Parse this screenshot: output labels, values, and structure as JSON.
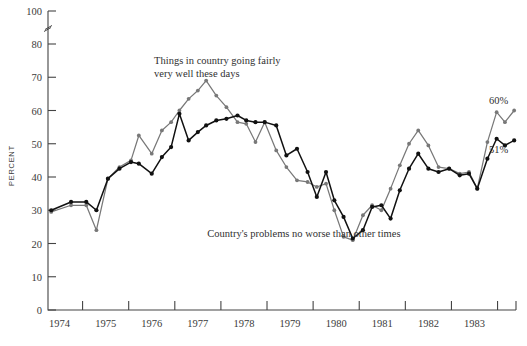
{
  "chart_data": {
    "type": "line",
    "title": "",
    "xlabel": "",
    "ylabel": "PERCENT",
    "ylim": [
      0,
      100
    ],
    "yticks": [
      0,
      10,
      20,
      30,
      40,
      50,
      60,
      70,
      80,
      100
    ],
    "axis_break_between": [
      80,
      100
    ],
    "grid": false,
    "legend": "annotations-inline",
    "xlim": [
      1973.75,
      1983.9
    ],
    "xticks": [
      1974,
      1975,
      1976,
      1977,
      1978,
      1979,
      1980,
      1981,
      1982,
      1983
    ],
    "xtick_labels": [
      "1974",
      "1975",
      "1976",
      "1977",
      "1978",
      "1979",
      "1980",
      "1981",
      "1982",
      "1983"
    ],
    "annotations": [
      {
        "name": "gray-series-annotation",
        "text_line1": "Things in country going fairly",
        "text_line2": "very well these days",
        "x": 1976.05,
        "y": 74
      },
      {
        "name": "black-series-annotation",
        "text": "Country's problems no worse than other times",
        "x": 1979.3,
        "y": 22
      }
    ],
    "end_labels": [
      {
        "name": "gray-end-label",
        "text": "60%",
        "value": 60,
        "color": "#777777"
      },
      {
        "name": "black-end-label",
        "text": "51%",
        "value": 51,
        "color": "#000000"
      }
    ],
    "series": [
      {
        "name": "Things in country going fairly very well these days",
        "color": "#787878",
        "marker": "circle",
        "points": [
          [
            1973.82,
            29.5
          ],
          [
            1974.25,
            31.5
          ],
          [
            1974.58,
            31.5
          ],
          [
            1974.8,
            24.0
          ],
          [
            1975.05,
            39.5
          ],
          [
            1975.3,
            43.0
          ],
          [
            1975.55,
            45.0
          ],
          [
            1975.72,
            52.5
          ],
          [
            1976.0,
            47.0
          ],
          [
            1976.22,
            54.0
          ],
          [
            1976.42,
            56.5
          ],
          [
            1976.6,
            60.0
          ],
          [
            1976.8,
            63.5
          ],
          [
            1977.0,
            66.0
          ],
          [
            1977.18,
            69.0
          ],
          [
            1977.4,
            64.5
          ],
          [
            1977.62,
            61.0
          ],
          [
            1977.86,
            56.5
          ],
          [
            1978.05,
            56.0
          ],
          [
            1978.25,
            50.5
          ],
          [
            1978.45,
            56.5
          ],
          [
            1978.7,
            48.0
          ],
          [
            1978.92,
            43.0
          ],
          [
            1979.15,
            39.0
          ],
          [
            1979.38,
            38.5
          ],
          [
            1979.58,
            37.0
          ],
          [
            1979.78,
            38.0
          ],
          [
            1979.96,
            30.0
          ],
          [
            1980.16,
            22.0
          ],
          [
            1980.36,
            21.0
          ],
          [
            1980.58,
            28.5
          ],
          [
            1980.78,
            31.5
          ],
          [
            1980.98,
            30.0
          ],
          [
            1981.18,
            36.5
          ],
          [
            1981.38,
            43.5
          ],
          [
            1981.58,
            50.0
          ],
          [
            1981.78,
            54.0
          ],
          [
            1982.0,
            49.5
          ],
          [
            1982.22,
            43.0
          ],
          [
            1982.45,
            42.5
          ],
          [
            1982.68,
            41.0
          ],
          [
            1982.88,
            41.5
          ],
          [
            1983.06,
            36.5
          ],
          [
            1983.28,
            50.5
          ],
          [
            1983.48,
            59.5
          ],
          [
            1983.66,
            56.5
          ],
          [
            1983.86,
            60.0
          ]
        ]
      },
      {
        "name": "Country's problems no worse than other times",
        "color": "#111111",
        "marker": "circle",
        "points": [
          [
            1973.82,
            30.0
          ],
          [
            1974.25,
            32.5
          ],
          [
            1974.58,
            32.5
          ],
          [
            1974.8,
            30.0
          ],
          [
            1975.05,
            39.5
          ],
          [
            1975.3,
            42.5
          ],
          [
            1975.55,
            44.5
          ],
          [
            1975.72,
            44.0
          ],
          [
            1976.0,
            41.0
          ],
          [
            1976.22,
            46.0
          ],
          [
            1976.42,
            49.0
          ],
          [
            1976.6,
            59.0
          ],
          [
            1976.8,
            51.0
          ],
          [
            1977.0,
            53.5
          ],
          [
            1977.18,
            55.5
          ],
          [
            1977.4,
            57.0
          ],
          [
            1977.62,
            57.5
          ],
          [
            1977.86,
            58.5
          ],
          [
            1978.05,
            57.0
          ],
          [
            1978.25,
            56.5
          ],
          [
            1978.45,
            56.5
          ],
          [
            1978.7,
            55.5
          ],
          [
            1978.92,
            46.5
          ],
          [
            1979.15,
            48.5
          ],
          [
            1979.38,
            41.5
          ],
          [
            1979.58,
            34.0
          ],
          [
            1979.78,
            41.5
          ],
          [
            1979.96,
            33.0
          ],
          [
            1980.16,
            28.0
          ],
          [
            1980.36,
            21.5
          ],
          [
            1980.58,
            24.0
          ],
          [
            1980.78,
            31.0
          ],
          [
            1980.98,
            31.5
          ],
          [
            1981.18,
            27.5
          ],
          [
            1981.38,
            36.0
          ],
          [
            1981.58,
            42.5
          ],
          [
            1981.78,
            47.0
          ],
          [
            1982.0,
            42.5
          ],
          [
            1982.22,
            41.5
          ],
          [
            1982.45,
            42.5
          ],
          [
            1982.68,
            40.5
          ],
          [
            1982.88,
            41.0
          ],
          [
            1983.06,
            36.5
          ],
          [
            1983.28,
            45.5
          ],
          [
            1983.48,
            51.5
          ],
          [
            1983.66,
            49.5
          ],
          [
            1983.86,
            51.0
          ]
        ]
      }
    ]
  }
}
